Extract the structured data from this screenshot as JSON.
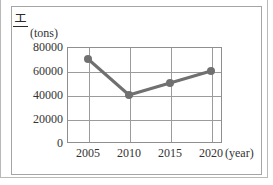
{
  "option_marker": {
    "label": "エ"
  },
  "chart_data": {
    "type": "line",
    "title": "",
    "subtitle": "",
    "xlabel": "(year)",
    "ylabel": "(tons)",
    "categories": [
      "2005",
      "2010",
      "2015",
      "2020"
    ],
    "x": [
      2005,
      2010,
      2015,
      2020
    ],
    "values": [
      70000,
      40000,
      50000,
      60000
    ],
    "series": [
      {
        "name": "",
        "values": [
          70000,
          40000,
          50000,
          60000
        ]
      }
    ],
    "y_ticks": [
      "80000",
      "60000",
      "40000",
      "20000",
      "0"
    ],
    "y_tick_values": [
      80000,
      60000,
      40000,
      20000,
      0
    ],
    "ylim": [
      0,
      80000
    ],
    "xlim": [
      2002.5,
      2022.5
    ],
    "grid": true,
    "legend": "none",
    "marker": "circle",
    "line_color": "#707070",
    "marker_color": "#707070",
    "grid_color": "#9b9b9b",
    "axis_color": "#8f8f8f"
  }
}
